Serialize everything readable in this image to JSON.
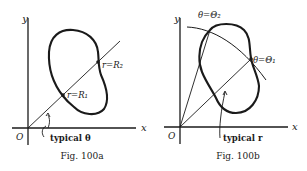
{
  "figures": [
    {
      "id": "fig-100a",
      "caption": "Fig. 100a",
      "axis_x_label": "x",
      "axis_y_label": "y",
      "origin_label": "O",
      "point_labels": [
        "r=R₁",
        "r=R₂"
      ],
      "angle_label": "typical θ"
    },
    {
      "id": "fig-100b",
      "caption": "Fig. 100b",
      "axis_x_label": "x",
      "axis_y_label": "y",
      "origin_label": "O",
      "ray_labels": [
        "θ=Θ₂",
        "θ=Θ₁"
      ],
      "radius_label": "typical r"
    }
  ],
  "colors": {
    "ink": "#1a1a1a",
    "background": "#ffffff"
  }
}
